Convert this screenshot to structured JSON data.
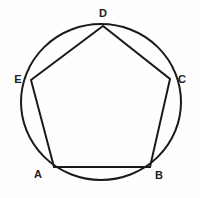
{
  "figure": {
    "background_color": "#fefefe",
    "stroke_color": "#1a1a1a",
    "label_color": "#1c1c1c",
    "circle": {
      "center_x": 101,
      "center_y": 102,
      "radius_x": 80,
      "radius_y": 78,
      "stroke_width": 2.0
    },
    "polygon": {
      "type": "pentagon",
      "stroke_width": 2.0,
      "sides": 5
    },
    "vertices": [
      {
        "id": "D",
        "label": "D",
        "x": 103,
        "y": 26,
        "label_x": 103,
        "label_y": 13
      },
      {
        "id": "E",
        "label": "E",
        "x": 31,
        "y": 80,
        "label_x": 18,
        "label_y": 79
      },
      {
        "id": "C",
        "label": "C",
        "x": 170,
        "y": 79,
        "label_x": 182,
        "label_y": 79
      },
      {
        "id": "A",
        "label": "A",
        "x": 54,
        "y": 167,
        "label_x": 38,
        "label_y": 174
      },
      {
        "id": "B",
        "label": "B",
        "x": 150,
        "y": 167,
        "label_x": 159,
        "label_y": 175
      }
    ],
    "edges": [
      {
        "from": "E",
        "to": "D"
      },
      {
        "from": "D",
        "to": "C"
      },
      {
        "from": "C",
        "to": "B"
      },
      {
        "from": "B",
        "to": "A"
      },
      {
        "from": "A",
        "to": "E"
      }
    ]
  }
}
